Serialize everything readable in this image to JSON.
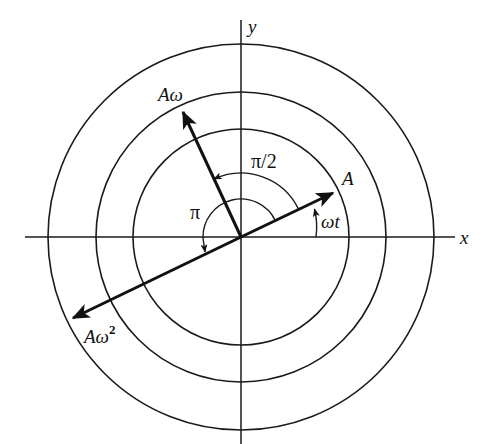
{
  "figure": {
    "type": "phasor diagram",
    "center": [
      241,
      237
    ],
    "circles": [
      {
        "name": "inner",
        "r": 108
      },
      {
        "name": "middle",
        "r": 145
      },
      {
        "name": "outer",
        "r": 193
      }
    ],
    "axes": {
      "x": {
        "label": "x",
        "from": 25,
        "to": 455
      },
      "y": {
        "label": "y",
        "from": 20,
        "to": 444
      }
    },
    "vectors": [
      {
        "name": "displacement",
        "label": "A",
        "angle_deg": 25.6,
        "length": 102
      },
      {
        "name": "velocity",
        "label": "Aω",
        "angle_deg": 115,
        "length": 138
      },
      {
        "name": "acceleration",
        "label": "Aω²",
        "angle_deg": 205.6,
        "length": 186
      }
    ],
    "angles": [
      {
        "name": "phase",
        "label": "ωt"
      },
      {
        "name": "quarter-turn",
        "label": "π/2"
      },
      {
        "name": "half-turn",
        "label": "π"
      }
    ]
  },
  "labels": {
    "x_axis": "x",
    "y_axis": "y",
    "A": "A",
    "A_omega_base": "Aω",
    "A_omega2_base": "Aω",
    "A_omega2_sup": "2",
    "omega_t": "ωt",
    "pi_half": "π/2",
    "pi": "π"
  }
}
